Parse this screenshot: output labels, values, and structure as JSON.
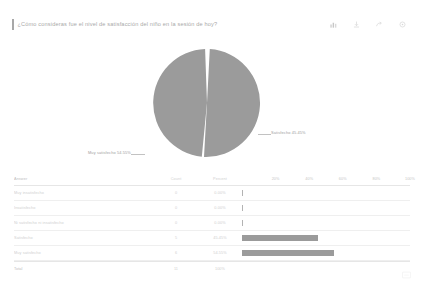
{
  "header": {
    "question_title": "¿Cómo consideras fue el nivel de satisfacción del niño en la sesión de hoy?",
    "icons": [
      {
        "name": "bar-chart-icon",
        "label": "Chart view"
      },
      {
        "name": "download-icon",
        "label": "Download"
      },
      {
        "name": "share-icon",
        "label": "Share"
      },
      {
        "name": "settings-icon",
        "label": "Options"
      }
    ]
  },
  "chart_data": {
    "type": "pie",
    "title": "¿Cómo consideras fue el nivel de satisfacción del niño en la sesión de hoy?",
    "categories": [
      "Muy satisfecho",
      "Satisfecho"
    ],
    "values": [
      54.55,
      45.45
    ],
    "labels": [
      {
        "text": "Muy satisfecho  54.55%",
        "position": "left"
      },
      {
        "text": "Satisfecho  45.45%",
        "position": "right"
      }
    ],
    "legend": "none",
    "colors": {
      "slice": "#9b9b9b",
      "divider": "#ffffff"
    }
  },
  "table": {
    "columns": [
      "Answer",
      "Count",
      "Percent"
    ],
    "axis_ticks": [
      "20%",
      "40%",
      "60%",
      "80%",
      "100%"
    ],
    "rows": [
      {
        "answer": "Muy insatisfecho",
        "count": "0",
        "percent": "0.00%",
        "bar_pct": 0
      },
      {
        "answer": "Insatisfecho",
        "count": "0",
        "percent": "0.00%",
        "bar_pct": 0
      },
      {
        "answer": "Ni satisfecho ni insatisfecho",
        "count": "0",
        "percent": "0.00%",
        "bar_pct": 0
      },
      {
        "answer": "Satisfecho",
        "count": "5",
        "percent": "45.45%",
        "bar_pct": 45.45
      },
      {
        "answer": "Muy satisfecho",
        "count": "6",
        "percent": "54.55%",
        "bar_pct": 54.55
      }
    ],
    "total": {
      "answer": "Total",
      "count": "11",
      "percent": "100%"
    }
  },
  "corner": {
    "name": "resize-handle-icon"
  }
}
